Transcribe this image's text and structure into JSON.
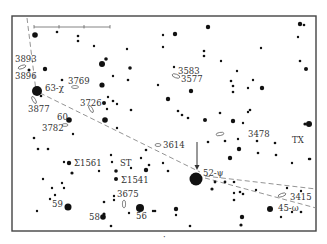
{
  "map": {
    "type": "star-chart",
    "frame": {
      "x": 12,
      "y": 16,
      "width": 304,
      "height": 215
    },
    "colors": {
      "ink": "#111111",
      "label": "#333333",
      "dashed": "#888888",
      "frame": "#444444"
    },
    "scale_bar": {
      "x1": 34,
      "x2": 110,
      "y": 27,
      "ticks": [
        34,
        59,
        84,
        110
      ]
    },
    "arrow": {
      "x": 197,
      "y1": 142,
      "y2": 170
    },
    "dashed_lines": [
      {
        "points": [
          [
            27,
            18
          ],
          [
            36,
            91
          ]
        ]
      },
      {
        "points": [
          [
            40,
            93
          ],
          [
            200,
            172
          ]
        ]
      },
      {
        "points": [
          [
            205,
            176
          ],
          [
            316,
            189
          ]
        ]
      },
      {
        "points": [
          [
            205,
            178
          ],
          [
            316,
            208
          ]
        ]
      }
    ],
    "labels": [
      {
        "id": "ngc3893",
        "text": "3893",
        "x": 15,
        "y": 62
      },
      {
        "id": "ngc3896",
        "text": "3896",
        "x": 15,
        "y": 79
      },
      {
        "id": "ngc3769",
        "text": "3769",
        "x": 68,
        "y": 84
      },
      {
        "id": "star63",
        "text": "63-χ",
        "x": 45,
        "y": 91
      },
      {
        "id": "ngc3877",
        "text": "3877",
        "x": 28,
        "y": 112
      },
      {
        "id": "ngc3726",
        "text": "3726",
        "x": 80,
        "y": 106
      },
      {
        "id": "star60",
        "text": "60",
        "x": 57,
        "y": 120
      },
      {
        "id": "ngc3782",
        "text": "3782",
        "x": 42,
        "y": 131
      },
      {
        "id": "ngc3583",
        "text": "3583",
        "x": 178,
        "y": 74
      },
      {
        "id": "ngc3577",
        "text": "3577",
        "x": 181,
        "y": 82
      },
      {
        "id": "ngc3614",
        "text": "3614",
        "x": 163,
        "y": 148
      },
      {
        "id": "ngc3478",
        "text": "3478",
        "x": 248,
        "y": 137
      },
      {
        "id": "txumae",
        "text": "TX",
        "x": 292,
        "y": 143
      },
      {
        "id": "sigma1561",
        "text": "Σ1561",
        "x": 74,
        "y": 166
      },
      {
        "id": "st",
        "text": "ST",
        "x": 120,
        "y": 166
      },
      {
        "id": "sigma1541",
        "text": "Σ1541",
        "x": 121,
        "y": 183
      },
      {
        "id": "ngc3675",
        "text": "3675",
        "x": 117,
        "y": 197
      },
      {
        "id": "star52",
        "text": "52-ψ",
        "x": 203,
        "y": 176
      },
      {
        "id": "ngc3415",
        "text": "3415",
        "x": 290,
        "y": 200
      },
      {
        "id": "star45",
        "text": "45-ω",
        "x": 278,
        "y": 211
      },
      {
        "id": "star59",
        "text": "59",
        "x": 52,
        "y": 207
      },
      {
        "id": "star58",
        "text": "58",
        "x": 89,
        "y": 220
      },
      {
        "id": "star56",
        "text": "56",
        "x": 136,
        "y": 219
      }
    ],
    "galaxies": [
      {
        "x": 22,
        "y": 67,
        "rx": 4,
        "ry": 1.6,
        "rot": -20
      },
      {
        "x": 75,
        "y": 87,
        "rx": 3.5,
        "ry": 1.5,
        "rot": 0
      },
      {
        "x": 34,
        "y": 100,
        "rx": 4,
        "ry": 1.5,
        "rot": 60
      },
      {
        "x": 91,
        "y": 109,
        "rx": 4,
        "ry": 1.5,
        "rot": 60
      },
      {
        "x": 65,
        "y": 125,
        "rx": 3,
        "ry": 1.4,
        "rot": 0
      },
      {
        "x": 176,
        "y": 76,
        "rx": 4,
        "ry": 1.8,
        "rot": 20
      },
      {
        "x": 220,
        "y": 134,
        "rx": 4,
        "ry": 1.6,
        "rot": -10
      },
      {
        "x": 158,
        "y": 145,
        "rx": 3,
        "ry": 1.5,
        "rot": 0
      },
      {
        "x": 124,
        "y": 204,
        "rx": 1.6,
        "ry": 4,
        "rot": 0
      },
      {
        "x": 282,
        "y": 195,
        "rx": 4,
        "ry": 1.6,
        "rot": -20
      }
    ],
    "stars": [
      {
        "x": 35,
        "y": 35,
        "r": 2.8
      },
      {
        "x": 57,
        "y": 32,
        "r": 1.3
      },
      {
        "x": 78,
        "y": 36,
        "r": 1.3
      },
      {
        "x": 78,
        "y": 41,
        "r": 1.3
      },
      {
        "x": 94,
        "y": 46,
        "r": 1.2
      },
      {
        "x": 102,
        "y": 64,
        "r": 3
      },
      {
        "x": 106,
        "y": 59,
        "r": 1.8
      },
      {
        "x": 45,
        "y": 69,
        "r": 2.2
      },
      {
        "x": 29,
        "y": 70,
        "r": 1.5
      },
      {
        "x": 127,
        "y": 49,
        "r": 1.2
      },
      {
        "x": 130,
        "y": 68,
        "r": 1.8
      },
      {
        "x": 113,
        "y": 76,
        "r": 1.2
      },
      {
        "x": 62,
        "y": 80,
        "r": 1.3
      },
      {
        "x": 102,
        "y": 85,
        "r": 2.6
      },
      {
        "x": 37,
        "y": 91,
        "r": 5
      },
      {
        "x": 41,
        "y": 96,
        "r": 1.3
      },
      {
        "x": 104,
        "y": 103,
        "r": 2
      },
      {
        "x": 113,
        "y": 101,
        "r": 1.3
      },
      {
        "x": 131,
        "y": 110,
        "r": 1.3
      },
      {
        "x": 69,
        "y": 120,
        "r": 2.8
      },
      {
        "x": 105,
        "y": 120,
        "r": 2.8
      },
      {
        "x": 117,
        "y": 128,
        "r": 1.2
      },
      {
        "x": 73,
        "y": 134,
        "r": 1.2
      },
      {
        "x": 163,
        "y": 35,
        "r": 1.2
      },
      {
        "x": 175,
        "y": 34,
        "r": 2.2
      },
      {
        "x": 208,
        "y": 27,
        "r": 2.2
      },
      {
        "x": 163,
        "y": 47,
        "r": 1.2
      },
      {
        "x": 204,
        "y": 51,
        "r": 1.3
      },
      {
        "x": 204,
        "y": 56,
        "r": 1.3
      },
      {
        "x": 221,
        "y": 61,
        "r": 1.2
      },
      {
        "x": 237,
        "y": 71,
        "r": 1.2
      },
      {
        "x": 261,
        "y": 48,
        "r": 1.2
      },
      {
        "x": 300,
        "y": 24,
        "r": 2.2
      },
      {
        "x": 304,
        "y": 25,
        "r": 1.3
      },
      {
        "x": 298,
        "y": 37,
        "r": 1.2
      },
      {
        "x": 300,
        "y": 61,
        "r": 1.3
      },
      {
        "x": 306,
        "y": 69,
        "r": 2
      },
      {
        "x": 174,
        "y": 67,
        "r": 1.2
      },
      {
        "x": 191,
        "y": 91,
        "r": 2.2
      },
      {
        "x": 158,
        "y": 85,
        "r": 1.2
      },
      {
        "x": 231,
        "y": 81,
        "r": 1.3
      },
      {
        "x": 233,
        "y": 86,
        "r": 1.3
      },
      {
        "x": 233,
        "y": 92,
        "r": 1.3
      },
      {
        "x": 248,
        "y": 88,
        "r": 1.2
      },
      {
        "x": 253,
        "y": 80,
        "r": 1.2
      },
      {
        "x": 262,
        "y": 88,
        "r": 2.2
      },
      {
        "x": 168,
        "y": 99,
        "r": 2.2
      },
      {
        "x": 178,
        "y": 111,
        "r": 1.3
      },
      {
        "x": 182,
        "y": 115,
        "r": 1.3
      },
      {
        "x": 188,
        "y": 118,
        "r": 1.3
      },
      {
        "x": 250,
        "y": 110,
        "r": 1.3
      },
      {
        "x": 233,
        "y": 121,
        "r": 2.2
      },
      {
        "x": 248,
        "y": 112,
        "r": 1.2
      },
      {
        "x": 205,
        "y": 120,
        "r": 2
      },
      {
        "x": 220,
        "y": 113,
        "r": 1.3
      },
      {
        "x": 243,
        "y": 123,
        "r": 1.2
      },
      {
        "x": 208,
        "y": 142,
        "r": 1.3
      },
      {
        "x": 225,
        "y": 141,
        "r": 1.3
      },
      {
        "x": 238,
        "y": 139,
        "r": 1.2
      },
      {
        "x": 257,
        "y": 141,
        "r": 1.3
      },
      {
        "x": 239,
        "y": 149,
        "r": 2.2
      },
      {
        "x": 258,
        "y": 153,
        "r": 1.3
      },
      {
        "x": 275,
        "y": 143,
        "r": 1.3
      },
      {
        "x": 276,
        "y": 155,
        "r": 1.3
      },
      {
        "x": 309,
        "y": 124,
        "r": 3
      },
      {
        "x": 305,
        "y": 124,
        "r": 1.6
      },
      {
        "x": 292,
        "y": 163,
        "r": 1.2
      },
      {
        "x": 309,
        "y": 159,
        "r": 1.2
      },
      {
        "x": 310,
        "y": 159,
        "r": 1.3
      },
      {
        "x": 230,
        "y": 158,
        "r": 2.2
      },
      {
        "x": 163,
        "y": 163,
        "r": 1.2
      },
      {
        "x": 168,
        "y": 171,
        "r": 1.3
      },
      {
        "x": 196,
        "y": 179,
        "r": 6.5
      },
      {
        "x": 215,
        "y": 182,
        "r": 1.4
      },
      {
        "x": 225,
        "y": 182,
        "r": 1.4
      },
      {
        "x": 234,
        "y": 182,
        "r": 1.3
      },
      {
        "x": 212,
        "y": 189,
        "r": 1.6
      },
      {
        "x": 234,
        "y": 193,
        "r": 1.2
      },
      {
        "x": 240,
        "y": 192,
        "r": 1.3
      },
      {
        "x": 243,
        "y": 194,
        "r": 1.3
      },
      {
        "x": 234,
        "y": 200,
        "r": 1.3
      },
      {
        "x": 256,
        "y": 190,
        "r": 1.2
      },
      {
        "x": 287,
        "y": 188,
        "r": 1.2
      },
      {
        "x": 301,
        "y": 191,
        "r": 1.2
      },
      {
        "x": 270,
        "y": 209,
        "r": 3
      },
      {
        "x": 281,
        "y": 217,
        "r": 1.2
      },
      {
        "x": 292,
        "y": 212,
        "r": 1.2
      },
      {
        "x": 301,
        "y": 212,
        "r": 1.3
      },
      {
        "x": 242,
        "y": 217,
        "r": 2.2
      },
      {
        "x": 241,
        "y": 225,
        "r": 1.6
      },
      {
        "x": 176,
        "y": 209,
        "r": 2.2
      },
      {
        "x": 190,
        "y": 226,
        "r": 1.3
      },
      {
        "x": 176,
        "y": 215,
        "r": 1.2
      },
      {
        "x": 34,
        "y": 138,
        "r": 1.3
      },
      {
        "x": 38,
        "y": 149,
        "r": 1.3
      },
      {
        "x": 48,
        "y": 149,
        "r": 1.3
      },
      {
        "x": 64,
        "y": 162,
        "r": 1.2
      },
      {
        "x": 69,
        "y": 163,
        "r": 2.2
      },
      {
        "x": 72,
        "y": 173,
        "r": 1.6
      },
      {
        "x": 99,
        "y": 171,
        "r": 1.2
      },
      {
        "x": 112,
        "y": 162,
        "r": 1.2
      },
      {
        "x": 116,
        "y": 171,
        "r": 1.8
      },
      {
        "x": 116,
        "y": 179,
        "r": 2
      },
      {
        "x": 111,
        "y": 155,
        "r": 1.2
      },
      {
        "x": 146,
        "y": 150,
        "r": 1.3
      },
      {
        "x": 141,
        "y": 158,
        "r": 1.2
      },
      {
        "x": 149,
        "y": 165,
        "r": 1.3
      },
      {
        "x": 146,
        "y": 170,
        "r": 2.2
      },
      {
        "x": 131,
        "y": 168,
        "r": 1.2
      },
      {
        "x": 43,
        "y": 179,
        "r": 1.2
      },
      {
        "x": 52,
        "y": 188,
        "r": 1.2
      },
      {
        "x": 55,
        "y": 195,
        "r": 1.2
      },
      {
        "x": 50,
        "y": 199,
        "r": 1.2
      },
      {
        "x": 62,
        "y": 183,
        "r": 1.2
      },
      {
        "x": 64,
        "y": 188,
        "r": 1.2
      },
      {
        "x": 68,
        "y": 207,
        "r": 3.5
      },
      {
        "x": 37,
        "y": 211,
        "r": 1.2
      },
      {
        "x": 104,
        "y": 202,
        "r": 1.3
      },
      {
        "x": 114,
        "y": 196,
        "r": 1.2
      },
      {
        "x": 114,
        "y": 200,
        "r": 1.2
      },
      {
        "x": 104,
        "y": 214,
        "r": 1.6
      },
      {
        "x": 103,
        "y": 217,
        "r": 2.8
      },
      {
        "x": 111,
        "y": 226,
        "r": 1.3
      },
      {
        "x": 140,
        "y": 208,
        "r": 4
      },
      {
        "x": 129,
        "y": 213,
        "r": 1.2
      },
      {
        "x": 155,
        "y": 211,
        "r": 1.3
      },
      {
        "x": 153,
        "y": 211,
        "r": 1.2
      },
      {
        "x": 107,
        "y": 109,
        "r": 1.2
      },
      {
        "x": 128,
        "y": 80,
        "r": 1.3
      },
      {
        "x": 108,
        "y": 97,
        "r": 1.2
      },
      {
        "x": 117,
        "y": 104,
        "r": 1.2
      }
    ],
    "small_mark": {
      "x": 163,
      "y": 240,
      "text": "·"
    }
  }
}
